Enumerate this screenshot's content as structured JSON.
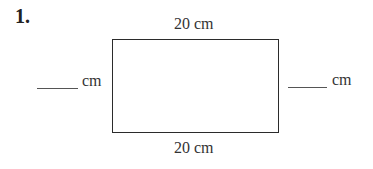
{
  "problem": {
    "number": "1.",
    "shape": "rectangle",
    "top_label": "20 cm",
    "bottom_label": "20 cm",
    "left_label": {
      "blank": "",
      "unit": "cm"
    },
    "right_label": {
      "blank": "",
      "unit": "cm"
    }
  }
}
